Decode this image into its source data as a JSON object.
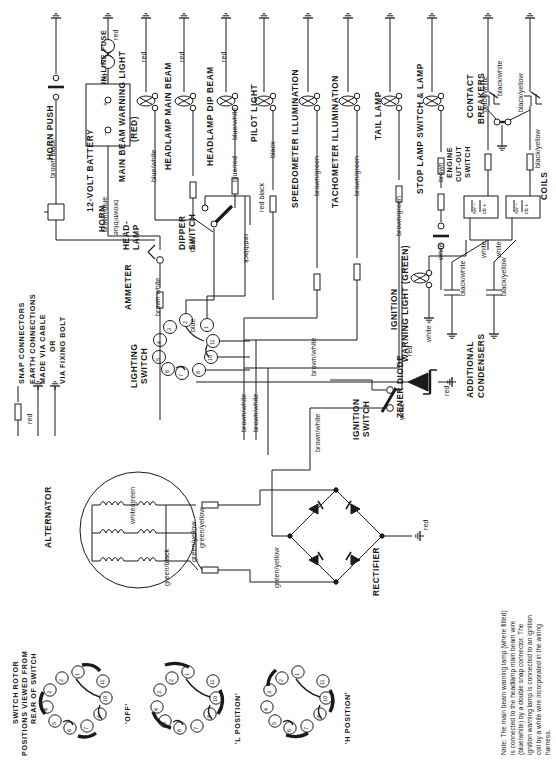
{
  "diagram": {
    "type": "automotive-wiring-schematic"
  },
  "legend": {
    "snap_connectors": "SNAP CONNECTORS",
    "earth_line1": "EARTH CONNECTIONS",
    "earth_line2": "MADE VIA CABLE",
    "earth_line3": "OR",
    "earth_line4": "VIA FIXING BOLT",
    "sample_wire": "red"
  },
  "components": {
    "horn_push": "HORN PUSH",
    "horn": "HORN",
    "battery": "12-VOLT BATTERY",
    "inline_fuse_l1": "IN-LINE FUSE",
    "headlamp_unit_l1": "HEAD-",
    "headlamp_unit_l2": "LAMP",
    "main_beam_warning_l1": "MAIN BEAM WARNING LIGHT",
    "main_beam_warning_l2": "(RED)",
    "headlamp_main_beam": "HEADLAMP MAIN BEAM",
    "headlamp_dip_beam": "HEADLAMP DIP BEAM",
    "pilot_light": "PILOT LIGHT",
    "speedometer_illumination": "SPEEDOMETER  ILLUMINATION",
    "tachometer_illumination": "TACHOMETER ILLUMINATION",
    "tail_lamp": "TAIL  LAMP",
    "stop_lamp_switch": "STOP LAMP SWITCH & LAMP",
    "contact_breakers_l1": "CONTACT",
    "contact_breakers_l2": "BREAKERS",
    "engine_cutout_l1": "ENGINE",
    "engine_cutout_l2": "CUT-OUT",
    "engine_cutout_l3": "SWITCH",
    "coils": "COILS",
    "ammeter": "AMMETER",
    "dipper_switch_l1": "DIPPER",
    "dipper_switch_l2": "SWITCH",
    "lighting_switch_l1": "LIGHTING",
    "lighting_switch_l2": "SWITCH",
    "ignition_warning_l1": "IGNITION",
    "ignition_warning_l2": "WARNING LIGHT (GREEN)",
    "ignition_switch_l1": "IGNITION",
    "ignition_switch_l2": "SWITCH",
    "zener_diode": "ZENER DIODE",
    "additional_condensers_l1": "ADDITIONAL",
    "additional_condensers_l2": "CONDENSERS",
    "alternator": "ALTERNATOR",
    "rectifier": "RECTIFIER"
  },
  "coil_terminals": {
    "sw": "sw −",
    "cb": "cb +"
  },
  "battery_terminals": {
    "positive": "+",
    "negative": "−"
  },
  "wires": {
    "brown_black": "brown  black",
    "brown_blue_1": "brown/blue",
    "brown_blue_2": "brown/blue",
    "brown_white_ammeter": "brown white",
    "red_fuse_top": "red",
    "red_fuse_bottom": "red",
    "red_1": "red",
    "red_2": "red",
    "red_3": "red",
    "red_4": "red",
    "red_5": "red",
    "red_6": "red",
    "red_7": "red",
    "red_8": "red",
    "red_9": "red",
    "red_10": "red",
    "red_11": "red",
    "red_12": "red",
    "red_13": "red",
    "blue_white": "blue/white",
    "blue_white_2": "blue/white",
    "blue_red": "blue/red",
    "black_pilot": "black",
    "brown_green_speedo": "brown/green",
    "brown_green_tacho": "brown/green",
    "brown_green_tail": "brown/green",
    "brown_stop_1": "brown",
    "brown_stop_2": "brown",
    "blue_1": "blue",
    "blue_2": "blue",
    "blue_3": "blue",
    "red_black": "red  black",
    "red_black_2": "red/black",
    "brown_green_a": "brown/green",
    "brown_green_b": "brown/green",
    "brown_green_c": "brown/green",
    "white_ign_warn": "white",
    "white_1": "white",
    "white_2": "white",
    "white_3": "white",
    "white_4": "white",
    "white_5": "white",
    "black_white_1": "black/white",
    "black_white_2": "black/white",
    "black_white_3": "black/white",
    "black_yellow_1": "black/yellow",
    "black_yellow_2": "black/yellow",
    "black_yellow_3": "black/yellow",
    "brown_white_1": "brown/white",
    "brown_white_2": "brown/white",
    "brown_white_3": "brown/white",
    "brown_white_4": "brown/white",
    "red_zener": "red",
    "red_rect": "red",
    "white_green": "white/green",
    "green_yellow_1": "green/yellow",
    "green_yellow_2": "green/yellow",
    "green_black": "green/black"
  },
  "lighting_switch": {
    "terminals": [
      "1",
      "2",
      "3",
      "4",
      "5",
      "6",
      "7",
      "8",
      "10",
      "11"
    ]
  },
  "rotor": {
    "heading_l1": "SWITCH ROTOR",
    "heading_l2": "POSITIONS VIEWED FROM",
    "heading_l3": "REAR OF SWITCH",
    "positions": [
      {
        "label": "'OFF'",
        "terminals": [
          "1",
          "2",
          "3",
          "4",
          "5",
          "6",
          "7",
          "8",
          "10",
          "11"
        ]
      },
      {
        "label": "'L POSITION'",
        "terminals": [
          "1",
          "2",
          "3",
          "4",
          "5",
          "6",
          "7",
          "8",
          "10",
          "11"
        ]
      },
      {
        "label": "'H POSITION'",
        "terminals": [
          "1",
          "2",
          "3",
          "4",
          "5",
          "6",
          "7",
          "8",
          "10",
          "11"
        ]
      }
    ]
  },
  "note": {
    "text": "Note: The main beam warning lamp (where fitted) is connected to the headlamp main beam wire (blue/white) by a double snap connector. The ignition warning lamp is connected to an ignition coil by a white wire incorporated in the wiring harness."
  },
  "colors": {
    "ink": "#111111",
    "paper": "#ffffff",
    "line": "#1a1a1a"
  }
}
